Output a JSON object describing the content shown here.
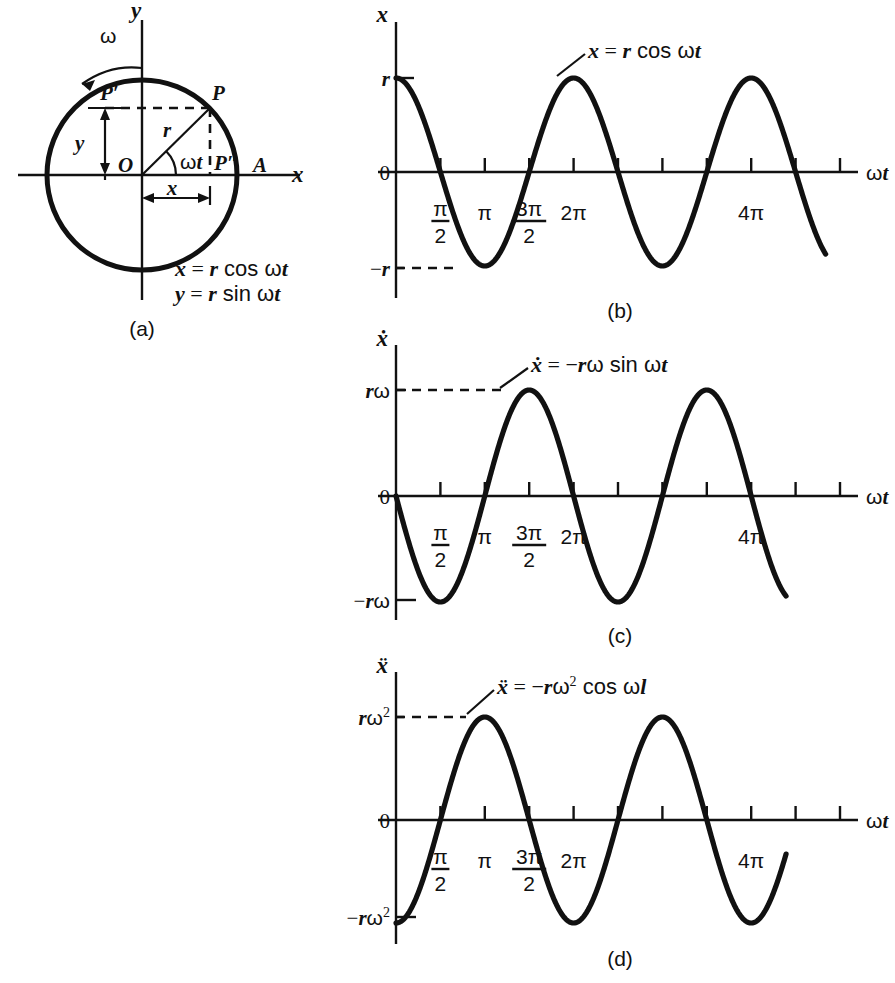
{
  "figure": {
    "background_color": "#ffffff",
    "ink_color": "#111111",
    "panels": [
      "(a)",
      "(b)",
      "(c)",
      "(d)"
    ]
  },
  "panel_a": {
    "caption": "(a)",
    "axis_labels": {
      "x": "x",
      "y": "y"
    },
    "points": {
      "origin": "O",
      "p": "P",
      "p_prime": "P′",
      "p_double_prime": "P″",
      "a": "A"
    },
    "segments": {
      "radius": "r",
      "angle": "ωt",
      "horizontal_projection": "x",
      "vertical_projection": "y"
    },
    "rotation_label": "ω",
    "equations": [
      "x = r cos ωt",
      "y = r sin ωt"
    ],
    "equation_parts": [
      {
        "lhs": "x",
        "rhs_amp": "r",
        "rhs_fn": "cos",
        "rhs_arg": "ωt"
      },
      {
        "lhs": "y",
        "rhs_amp": "r",
        "rhs_fn": "sin",
        "rhs_arg": "ωt"
      }
    ]
  },
  "chart_data": [
    {
      "id": "b",
      "caption": "(b)",
      "type": "line",
      "title": "",
      "equation": "x = r cos ωt",
      "equation_parts": {
        "lhs": "x",
        "amp": "r",
        "fn": "cos",
        "arg": "ωt"
      },
      "xlabel": "ωt",
      "ylabel": "x",
      "ylabel_dots": 0,
      "xlim": [
        0,
        15.708
      ],
      "ylim": [
        -1,
        1
      ],
      "amplitude_label": "r",
      "y_ticks": [
        {
          "value": 1,
          "label": "r"
        },
        {
          "value": 0,
          "label": "0"
        },
        {
          "value": -1,
          "label": "−r"
        }
      ],
      "x_ticks": [
        {
          "value": 1.5708,
          "label": "π/2",
          "numerator": "π",
          "denominator": "2"
        },
        {
          "value": 3.1416,
          "label": "π"
        },
        {
          "value": 4.7124,
          "label": "3π/2",
          "numerator": "3π",
          "denominator": "2"
        },
        {
          "value": 6.2832,
          "label": "2π"
        },
        {
          "value": 7.854,
          "label": ""
        },
        {
          "value": 9.4248,
          "label": ""
        },
        {
          "value": 10.996,
          "label": ""
        },
        {
          "value": 12.566,
          "label": "4π"
        },
        {
          "value": 14.137,
          "label": ""
        },
        {
          "value": 15.708,
          "label": ""
        }
      ],
      "dashed_guides": [
        {
          "from": "y-axis",
          "value": -1,
          "to_x": 3.1416
        }
      ],
      "series": [
        {
          "name": "x = r cos ωt",
          "function": "cos",
          "amplitude": 1,
          "phase": 0,
          "t_start": 0,
          "t_end": 15.2
        }
      ],
      "grid": false,
      "legend_position": "inline-annotation"
    },
    {
      "id": "c",
      "caption": "(c)",
      "type": "line",
      "title": "",
      "equation": "ẋ = −rω sin ωt",
      "equation_parts": {
        "lhs": "ẋ",
        "amp": "−rω",
        "fn": "sin",
        "arg": "ωt"
      },
      "xlabel": "ωt",
      "ylabel": "ẋ",
      "ylabel_dots": 1,
      "xlim": [
        0,
        15.708
      ],
      "ylim": [
        -1,
        1
      ],
      "amplitude_label": "rω",
      "y_ticks": [
        {
          "value": 1,
          "label": "rω"
        },
        {
          "value": 0,
          "label": "0"
        },
        {
          "value": -1,
          "label": "−rω"
        }
      ],
      "x_ticks": [
        {
          "value": 1.5708,
          "label": "π/2",
          "numerator": "π",
          "denominator": "2"
        },
        {
          "value": 3.1416,
          "label": "π"
        },
        {
          "value": 4.7124,
          "label": "3π/2",
          "numerator": "3π",
          "denominator": "2"
        },
        {
          "value": 6.2832,
          "label": "2π"
        },
        {
          "value": 7.854,
          "label": ""
        },
        {
          "value": 9.4248,
          "label": ""
        },
        {
          "value": 10.996,
          "label": ""
        },
        {
          "value": 12.566,
          "label": "4π"
        },
        {
          "value": 14.137,
          "label": ""
        },
        {
          "value": 15.708,
          "label": ""
        }
      ],
      "dashed_guides": [
        {
          "from": "y-axis",
          "value": 1,
          "to_x": 4.7124
        }
      ],
      "series": [
        {
          "name": "ẋ = −rω sin ωt",
          "function": "-sin",
          "amplitude": 1,
          "phase": 0,
          "t_start": 0,
          "t_end": 13.8
        }
      ],
      "grid": false,
      "legend_position": "inline-annotation"
    },
    {
      "id": "d",
      "caption": "(d)",
      "type": "line",
      "title": "",
      "equation": "ẍ = −rω² cos ωl",
      "equation_parts": {
        "lhs": "ẍ",
        "amp": "−rω",
        "amp_exp": "2",
        "fn": "cos",
        "arg": "ωl"
      },
      "xlabel": "ωt",
      "ylabel": "ẍ",
      "ylabel_dots": 2,
      "xlim": [
        0,
        15.708
      ],
      "ylim": [
        -1,
        1
      ],
      "amplitude_label": "rω²",
      "y_ticks": [
        {
          "value": 1,
          "label": "rω",
          "exp": "2"
        },
        {
          "value": 0,
          "label": "0"
        },
        {
          "value": -1,
          "label": "−rω",
          "exp": "2"
        }
      ],
      "x_ticks": [
        {
          "value": 1.5708,
          "label": "π/2",
          "numerator": "π",
          "denominator": "2"
        },
        {
          "value": 3.1416,
          "label": "π"
        },
        {
          "value": 4.7124,
          "label": "3π/2",
          "numerator": "3π",
          "denominator": "2"
        },
        {
          "value": 6.2832,
          "label": "2π"
        },
        {
          "value": 7.854,
          "label": ""
        },
        {
          "value": 9.4248,
          "label": ""
        },
        {
          "value": 10.996,
          "label": ""
        },
        {
          "value": 12.566,
          "label": "4π"
        },
        {
          "value": 14.137,
          "label": ""
        },
        {
          "value": 15.708,
          "label": ""
        }
      ],
      "dashed_guides": [
        {
          "from": "y-axis",
          "value": 1,
          "to_x": 3.1416
        }
      ],
      "series": [
        {
          "name": "ẍ = −rω² cos ωl",
          "function": "-cos",
          "amplitude": 1,
          "phase": 0,
          "t_start": 0,
          "t_end": 13.8
        }
      ],
      "grid": false,
      "legend_position": "inline-annotation"
    }
  ]
}
